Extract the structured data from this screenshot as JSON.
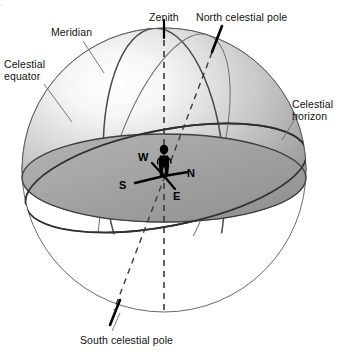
{
  "figure": {
    "background_color": "#ffffff",
    "width": 340,
    "height": 355
  },
  "labels": {
    "celestial_equator": "Celestial\nequator",
    "meridian": "Meridian",
    "zenith": "Zenith",
    "north_celestial_pole": "North celestial pole",
    "celestial_horizon": "Celestial\nhorizon",
    "south_celestial_pole": "South celestial pole"
  },
  "compass": {
    "north": "N",
    "south": "S",
    "east": "E",
    "west": "W"
  },
  "colors": {
    "sphere_light": "#fcfcfc",
    "sphere_mid": "#c9c9c9",
    "sphere_dark": "#9a9a9a",
    "horizon_plane": "#9d9d9d",
    "outline": "#4a4a4a",
    "line_dark": "#2b2b2b",
    "text": "#111111",
    "observer": "#000000",
    "leader": "#555555"
  },
  "elements": {
    "observer_figure": "human observer silhouette",
    "zenith_axis": "vertical dashed line through zenith and nadir",
    "polar_axis": "tilted dashed line through north and south celestial poles"
  },
  "cropped_top_text": "•"
}
